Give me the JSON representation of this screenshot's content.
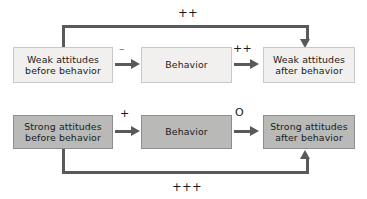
{
  "diagram": {
    "type": "flow-diagram",
    "background_color": "#ffffff",
    "connector_color": "#59595b",
    "rows": [
      {
        "id": "weak-row",
        "attitude_strength": "Weak",
        "box_fill": "#f1f0ee",
        "box_border": "#c9c8c5",
        "nodes": [
          {
            "id": "weak-before",
            "label": "Weak attitudes\nbefore behavior"
          },
          {
            "id": "weak-behavior",
            "label": "Behavior"
          },
          {
            "id": "weak-after",
            "label": "Weak attitudes\nafter behavior"
          }
        ],
        "edges": [
          {
            "id": "weak-before-to-behavior",
            "label": "–",
            "from": "weak-before",
            "to": "weak-behavior"
          },
          {
            "id": "weak-behavior-to-after",
            "label": "++",
            "from": "weak-behavior",
            "to": "weak-after"
          }
        ],
        "feedback": {
          "id": "weak-feedback-loop",
          "label": "++",
          "from": "weak-before",
          "to": "weak-after",
          "route": "over-top"
        }
      },
      {
        "id": "strong-row",
        "attitude_strength": "Strong",
        "box_fill": "#b9b9b7",
        "box_border": "#8d8d8b",
        "nodes": [
          {
            "id": "strong-before",
            "label": "Strong attitudes\nbefore behavior"
          },
          {
            "id": "strong-behavior",
            "label": "Behavior"
          },
          {
            "id": "strong-after",
            "label": "Strong attitudes\nafter behavior"
          }
        ],
        "edges": [
          {
            "id": "strong-before-to-behavior",
            "label": "+",
            "from": "strong-before",
            "to": "strong-behavior"
          },
          {
            "id": "strong-behavior-to-after",
            "label": "O",
            "from": "strong-behavior",
            "to": "strong-after"
          }
        ],
        "feedback": {
          "id": "strong-feedback-loop",
          "label": "+++",
          "from": "strong-before",
          "to": "strong-after",
          "route": "under-bottom"
        }
      }
    ]
  }
}
